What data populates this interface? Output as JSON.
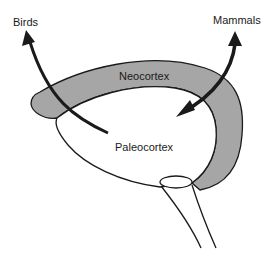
{
  "diagram": {
    "labels": {
      "birds": "Birds",
      "mammals": "Mammals",
      "neocortex": "Neocortex",
      "paleocortex": "Paleocortex"
    },
    "colors": {
      "neocortex_fill": "#a6a6a6",
      "paleocortex_fill": "#ffffff",
      "outline": "#1a1a1a",
      "arrow": "#1a1a1a",
      "background": "#ffffff"
    }
  }
}
